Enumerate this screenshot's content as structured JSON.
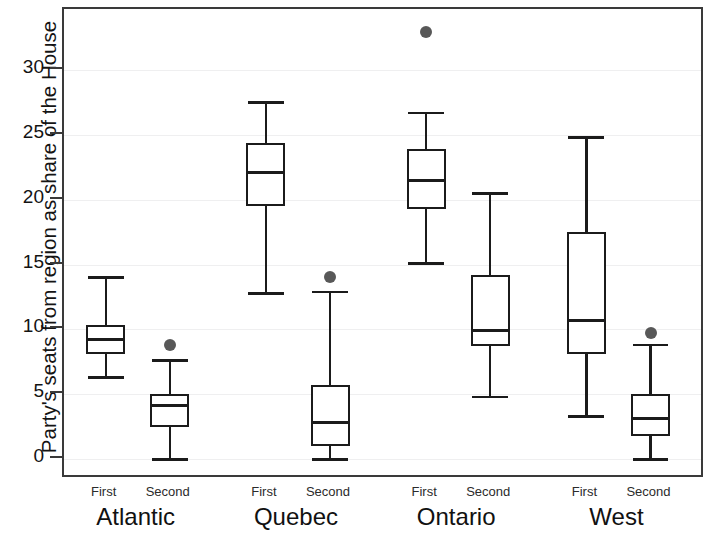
{
  "chart_data": {
    "type": "box",
    "title": "",
    "xlabel": "",
    "ylabel": "Party's seats from region as share of the House",
    "ylim": [
      -1.5,
      34.5
    ],
    "yticks": [
      0,
      5,
      10,
      15,
      20,
      25,
      30
    ],
    "ytick_labels": [
      "0",
      "5",
      "10",
      "15",
      "20",
      "25",
      "30"
    ],
    "grid": true,
    "legend": "none",
    "group_labels": [
      "Atlantic",
      "Quebec",
      "Ontario",
      "West"
    ],
    "sub_labels": [
      "First",
      "Second"
    ],
    "boxes": [
      {
        "group": "Atlantic",
        "position": "First",
        "whisker_low": 6.3,
        "q1": 8.1,
        "median": 9.2,
        "q3": 10.3,
        "whisker_high": 14.0,
        "outliers": []
      },
      {
        "group": "Atlantic",
        "position": "Second",
        "whisker_low": 0.0,
        "q1": 2.5,
        "median": 4.1,
        "q3": 5.0,
        "whisker_high": 7.6,
        "outliers": [
          8.8
        ]
      },
      {
        "group": "Quebec",
        "position": "First",
        "whisker_low": 12.8,
        "q1": 19.5,
        "median": 22.1,
        "q3": 24.4,
        "whisker_high": 27.5,
        "outliers": []
      },
      {
        "group": "Quebec",
        "position": "Second",
        "whisker_low": 0.0,
        "q1": 1.0,
        "median": 2.8,
        "q3": 5.7,
        "whisker_high": 12.9,
        "outliers": [
          14.0
        ]
      },
      {
        "group": "Ontario",
        "position": "First",
        "whisker_low": 15.1,
        "q1": 19.3,
        "median": 21.5,
        "q3": 23.9,
        "whisker_high": 26.7,
        "outliers": [
          32.9
        ]
      },
      {
        "group": "Ontario",
        "position": "Second",
        "whisker_low": 4.8,
        "q1": 8.7,
        "median": 9.9,
        "q3": 14.2,
        "whisker_high": 20.5,
        "outliers": []
      },
      {
        "group": "West",
        "position": "First",
        "whisker_low": 3.3,
        "q1": 8.1,
        "median": 10.7,
        "q3": 17.5,
        "whisker_high": 24.8,
        "outliers": []
      },
      {
        "group": "West",
        "position": "Second",
        "whisker_low": 0.0,
        "q1": 1.8,
        "median": 3.1,
        "q3": 5.0,
        "whisker_high": 8.8,
        "outliers": [
          9.7
        ]
      }
    ],
    "colors": {
      "box_line": "#1b1b1b",
      "outlier": "#585858",
      "frame": "#3a3a3a",
      "grid": "#efeff0",
      "background": "#ffffff"
    }
  }
}
